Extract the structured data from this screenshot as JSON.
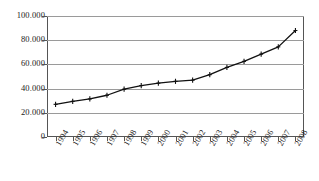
{
  "chart_data": {
    "type": "line",
    "title": "",
    "subtitle": "",
    "xlabel": "",
    "ylabel": "",
    "categories": [
      "1994",
      "1995",
      "1996",
      "1997",
      "1998",
      "1999",
      "2000",
      "2001",
      "2002",
      "2003",
      "2004",
      "2005",
      "2006",
      "2007",
      "2008"
    ],
    "values": [
      27000,
      29500,
      31500,
      34500,
      39500,
      42500,
      44500,
      46000,
      47000,
      51500,
      57500,
      62500,
      68500,
      74500,
      88000
    ],
    "series": [
      {
        "name": "series-1",
        "values": [
          27000,
          29500,
          31500,
          34500,
          39500,
          42500,
          44500,
          46000,
          47000,
          51500,
          57500,
          62500,
          68500,
          74500,
          88000
        ]
      }
    ],
    "ylim": [
      0,
      100000
    ],
    "yticks": [
      0,
      20000,
      40000,
      60000,
      80000,
      100000
    ],
    "ytick_labels": [
      "0",
      "20.000",
      "40.000",
      "60.000",
      "80.000",
      "100.000"
    ],
    "grid": true,
    "grid_axis": "y",
    "legend": false,
    "legend_position": "none",
    "marker": "cross",
    "line_color": "#111111",
    "grid_color": "#9a9a9a",
    "axis_color": "#555555",
    "background_color": "#ffffff",
    "xtick_label_rotation": -60
  }
}
